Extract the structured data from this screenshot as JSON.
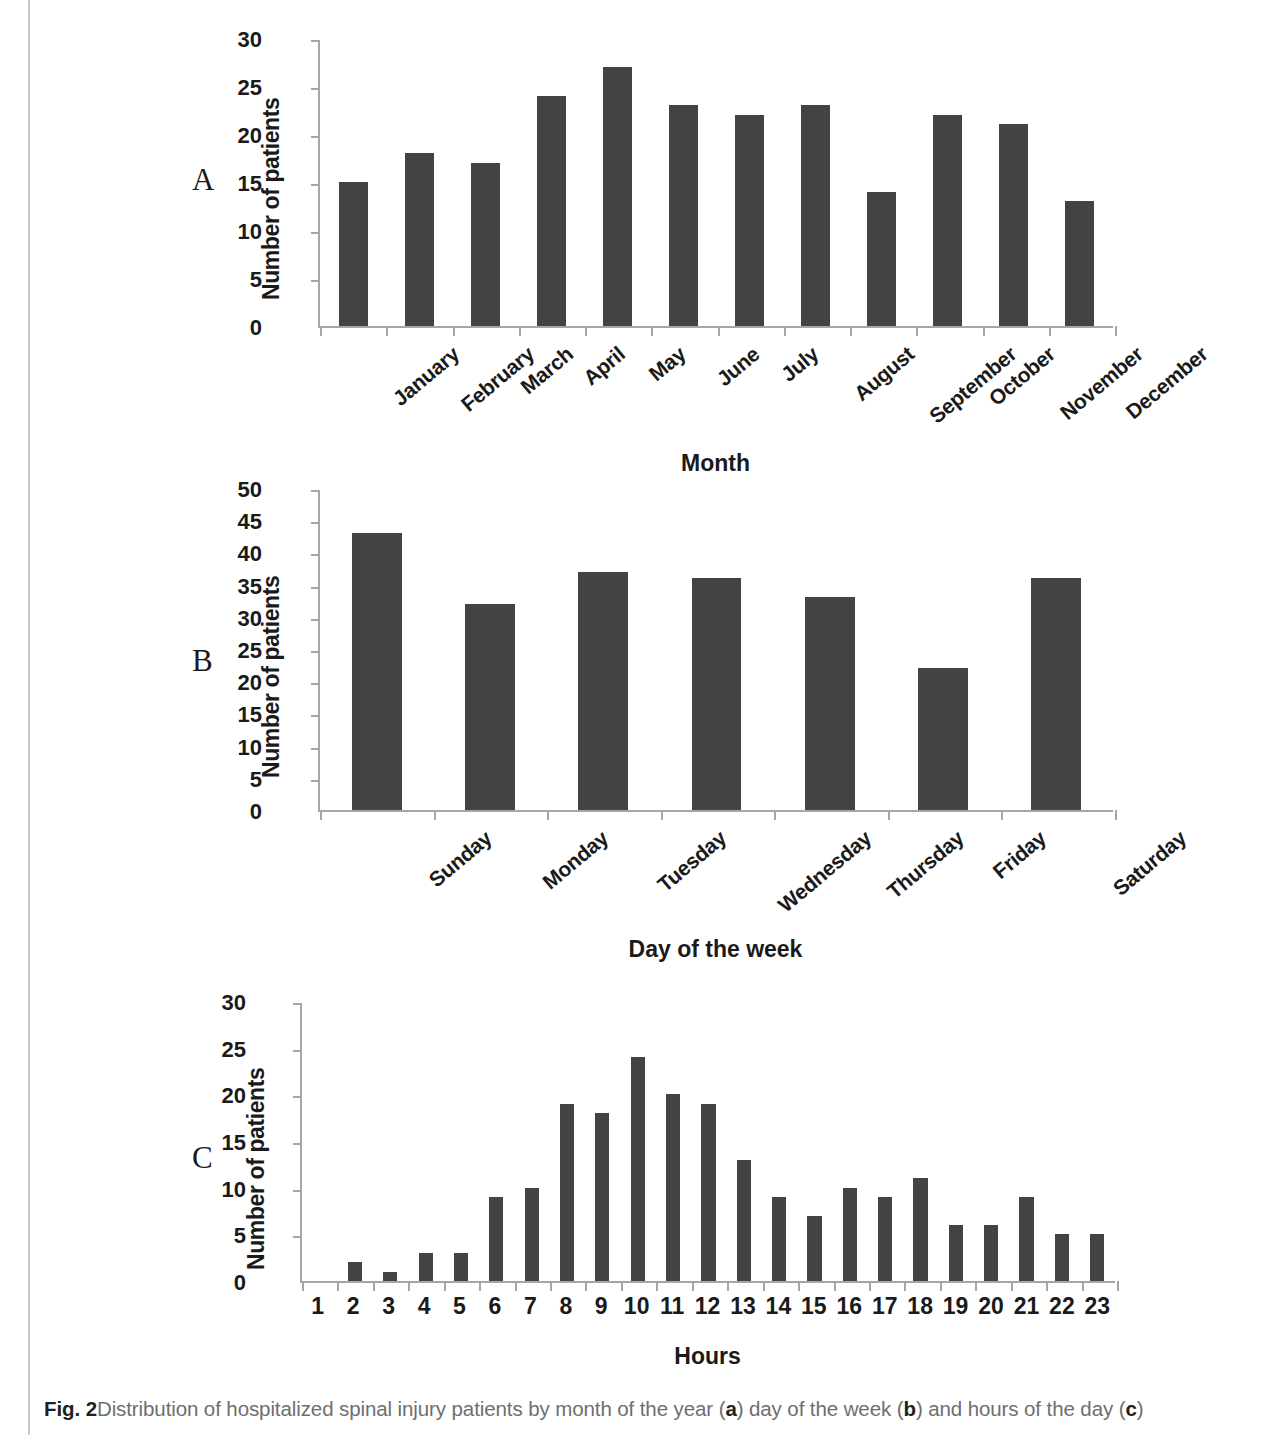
{
  "figure": {
    "caption_prefix": "Fig. 2",
    "caption_text": "Distribution of hospitalized spinal injury patients by month of the year (a) day of the week (b) and hours of the day (c)",
    "caption_part_1": "Distribution of hospitalized spinal injury patients by month of the year (",
    "caption_ref_a": "a",
    "caption_part_2": ") day of the week (",
    "caption_ref_b": "b",
    "caption_part_3": ") and hours of the day (",
    "caption_ref_c": "c",
    "caption_part_4": ")",
    "panel_a_letter": "A",
    "panel_b_letter": "B",
    "panel_c_letter": "C",
    "bar_color": "#444244",
    "axis_color": "#a6a6a6"
  },
  "chart_data": [
    {
      "type": "bar",
      "panel": "A",
      "title": "",
      "xlabel": "Month",
      "ylabel": "Number of patients",
      "categories": [
        "January",
        "February",
        "March",
        "April",
        "May",
        "June",
        "July",
        "August",
        "September",
        "October",
        "November",
        "December"
      ],
      "values": [
        15,
        18,
        17,
        24,
        27,
        23,
        22,
        23,
        14,
        22,
        21,
        13
      ],
      "ylim": [
        0,
        30
      ],
      "ytick_step": 5,
      "yticks": [
        0,
        5,
        10,
        15,
        20,
        25,
        30
      ],
      "grid": false,
      "legend": "none",
      "xtick_rotation": -40
    },
    {
      "type": "bar",
      "panel": "B",
      "title": "",
      "xlabel": "Day of the week",
      "ylabel": "Number of patients",
      "categories": [
        "Sunday",
        "Monday",
        "Tuesday",
        "Wednesday",
        "Thursday",
        "Friday",
        "Saturday"
      ],
      "values": [
        43,
        32,
        37,
        36,
        33,
        22,
        36
      ],
      "ylim": [
        0,
        50
      ],
      "ytick_step": 5,
      "yticks": [
        0,
        5,
        10,
        15,
        20,
        25,
        30,
        35,
        40,
        45,
        50
      ],
      "grid": false,
      "legend": "none",
      "xtick_rotation": -40
    },
    {
      "type": "bar",
      "panel": "C",
      "title": "",
      "xlabel": "Hours",
      "ylabel": "Number of patients",
      "categories": [
        "1",
        "2",
        "3",
        "4",
        "5",
        "6",
        "7",
        "8",
        "9",
        "10",
        "11",
        "12",
        "13",
        "14",
        "15",
        "16",
        "17",
        "18",
        "19",
        "20",
        "21",
        "22",
        "23"
      ],
      "values": [
        0,
        2,
        1,
        3,
        3,
        9,
        10,
        19,
        18,
        24,
        20,
        19,
        13,
        9,
        7,
        10,
        9,
        11,
        6,
        6,
        9,
        5,
        5
      ],
      "ylim": [
        0,
        30
      ],
      "ytick_step": 5,
      "yticks": [
        0,
        5,
        10,
        15,
        20,
        25,
        30
      ],
      "grid": false,
      "legend": "none",
      "xtick_rotation": 0
    }
  ]
}
